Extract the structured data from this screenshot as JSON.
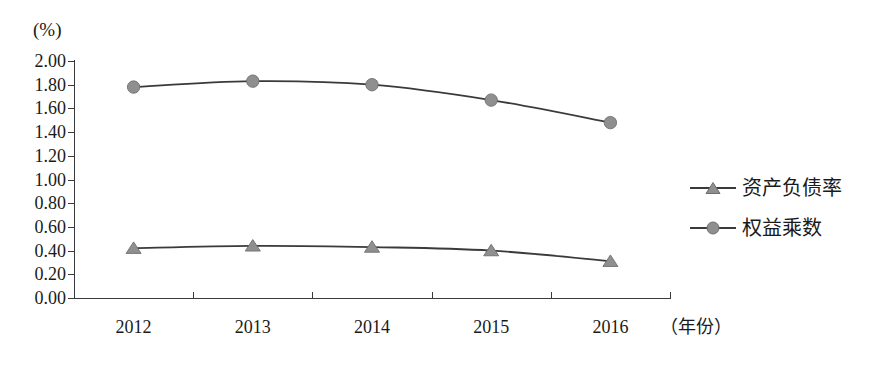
{
  "chart_data": {
    "type": "line",
    "title": "",
    "subtitle": "",
    "xlabel": "（年份）",
    "ylabel": "(%)",
    "categories": [
      "2012",
      "2013",
      "2014",
      "2015",
      "2016"
    ],
    "ylim": [
      0.0,
      2.0
    ],
    "ytick_step": 0.2,
    "ytick_labels": [
      "2.00",
      "1.80",
      "1.60",
      "1.40",
      "1.20",
      "1.00",
      "0.80",
      "0.60",
      "0.40",
      "0.20",
      "0.00"
    ],
    "grid": false,
    "legend_position": "right",
    "series": [
      {
        "name": "资产负债率",
        "marker": "triangle",
        "values": [
          0.42,
          0.44,
          0.43,
          0.4,
          0.31
        ]
      },
      {
        "name": "权益乘数",
        "marker": "circle",
        "values": [
          1.78,
          1.83,
          1.8,
          1.67,
          1.48
        ]
      }
    ]
  },
  "colors": {
    "line": "#3a3a3a",
    "marker": "#8f8f8f",
    "marker_stroke": "#6e6e6e",
    "axis": "#3a3a3a",
    "text": "#1a1a1a",
    "background": "#ffffff"
  }
}
